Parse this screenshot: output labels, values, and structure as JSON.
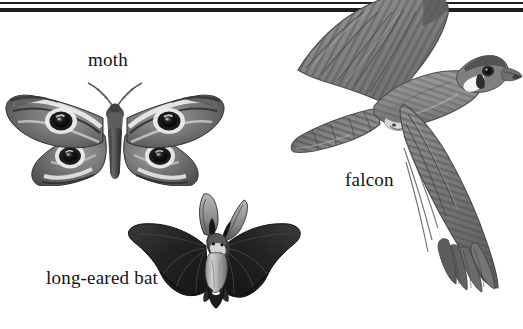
{
  "plate": {
    "type": "natural-history-illustration-plate",
    "background_color": "#ffffff",
    "width": 523,
    "height": 329,
    "rules": [
      {
        "name": "thin-rule",
        "color": "#1d1d1f",
        "y": 2,
        "thickness": 2
      },
      {
        "name": "thick-rule",
        "color": "#1d1d1f",
        "y": 8,
        "thickness": 4
      }
    ],
    "labels": {
      "moth": "moth",
      "falcon": "falcon",
      "bat": "long-eared bat"
    },
    "figures": [
      {
        "id": "moth",
        "label": "moth",
        "description": "Emperor moth with wings spread flat, four eyespots, feathery antennae",
        "eyespot_count": 4,
        "tones": {
          "dark": "#3a3a3a",
          "mid": "#7d7d7d",
          "light": "#c9c9c9",
          "highlight": "#f2f2f2"
        }
      },
      {
        "id": "long-eared-bat",
        "label": "long-eared bat",
        "description": "Long-eared bat in flight, very tall ears, dark membranous wings spread",
        "tones": {
          "dark": "#1e1e1e",
          "mid": "#585858",
          "light": "#b4b4b4",
          "highlight": "#e8e8e8"
        }
      },
      {
        "id": "falcon",
        "label": "falcon",
        "description": "Peregrine falcon in flight, upper wing raised through the top rules, lower wing swept down with splayed primaries, barred tail, dark malar stripe and white throat",
        "tones": {
          "dark": "#4a4a4a",
          "mid": "#8a8a8a",
          "light": "#bdbdbd",
          "highlight": "#ededed"
        }
      }
    ]
  }
}
